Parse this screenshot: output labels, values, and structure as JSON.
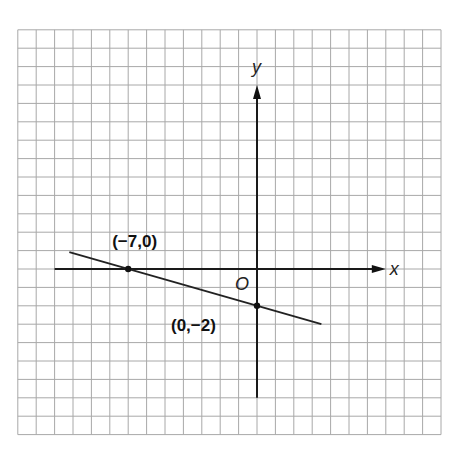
{
  "figure": {
    "type": "coordinate-plane-line-graph",
    "axis_labels": {
      "x": "x",
      "y": "y",
      "origin": "O"
    },
    "grid": {
      "x_range": [
        -13,
        10
      ],
      "y_range": [
        -9,
        13
      ],
      "unit": 1
    },
    "axes_extent": {
      "x": [
        -11,
        7
      ],
      "y": [
        -7,
        10
      ]
    },
    "line": {
      "equation": "y = -2/7 x - 2",
      "slope": -0.2857,
      "y_intercept": -2,
      "x_intercept": -7,
      "from_x": -10.2,
      "to_x": 3.5
    },
    "points": [
      {
        "x": -7,
        "y": 0,
        "label": "(−7,0)"
      },
      {
        "x": 0,
        "y": -2,
        "label": "(0,−2)"
      }
    ]
  },
  "chart_data": {
    "type": "line",
    "title": "",
    "xlabel": "x",
    "ylabel": "y",
    "origin_label": "O",
    "series": [
      {
        "name": "line",
        "x": [
          -10.2,
          -7,
          0,
          3.5
        ],
        "y": [
          0.914,
          0,
          -2,
          -3
        ]
      }
    ],
    "marked_points": [
      {
        "x": -7,
        "y": 0,
        "label": "(−7,0)"
      },
      {
        "x": 0,
        "y": -2,
        "label": "(0,−2)"
      }
    ],
    "xlim": [
      -13,
      10
    ],
    "ylim": [
      -9,
      13
    ],
    "grid": true,
    "legend": "none"
  }
}
